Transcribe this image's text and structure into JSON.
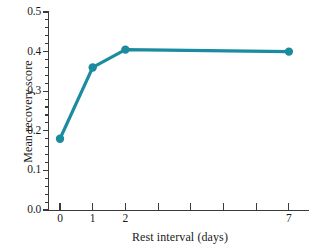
{
  "chart_data": {
    "type": "line",
    "title": "",
    "xlabel": "Rest interval (days)",
    "ylabel": "Mean recovery score",
    "x": [
      0,
      1,
      2,
      7
    ],
    "values": [
      0.18,
      0.36,
      0.405,
      0.4
    ],
    "series": [
      {
        "name": "Mean recovery score",
        "x": [
          0,
          1,
          2,
          7
        ],
        "values": [
          0.18,
          0.36,
          0.405,
          0.4
        ]
      }
    ],
    "xlim": [
      -0.35,
      7.7
    ],
    "ylim": [
      0.0,
      0.5
    ],
    "grid": false,
    "legend": null,
    "marker": "circle",
    "line_color": "#1B8BA0",
    "marker_color": "#1B8BA0",
    "y_ticks": [
      "0.0",
      "0.1",
      "0.2",
      "0.3",
      "0.4",
      "0.5"
    ],
    "y_tick_values": [
      0.0,
      0.1,
      0.2,
      0.3,
      0.4,
      0.5
    ],
    "y_minor_tick_step": 0.02,
    "x_ticks_labeled": [
      "0",
      "1",
      "2",
      "7"
    ],
    "x_tick_values_labeled": [
      0,
      1,
      2,
      7
    ],
    "x_tick_values_all": [
      0,
      1,
      2,
      3,
      4,
      5,
      6,
      7
    ]
  }
}
